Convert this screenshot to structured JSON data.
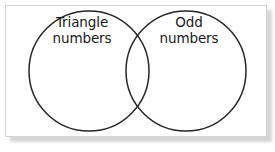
{
  "figure": {
    "name": "venn-diagram",
    "type": "two-set-venn",
    "background_color": "#ffffff",
    "card": {
      "border_color": "#d2d2d2",
      "fill_color": "#ffffff",
      "shadow_color": "#c9c9c9"
    },
    "stroke_color": "#262626",
    "stroke_width": 1.5,
    "text_color": "#1a1a1a"
  },
  "sets": [
    {
      "id": "left",
      "label_line1": "Triangle",
      "label_line2": "numbers",
      "center_x": 89,
      "center_y": 71,
      "radius": 60
    },
    {
      "id": "right",
      "label_line1": "Odd",
      "label_line2": "numbers",
      "center_x": 186,
      "center_y": 71,
      "radius": 60
    }
  ],
  "intersection": {
    "label": "",
    "upper_crossing_x": 137,
    "upper_crossing_y": 28,
    "lower_crossing_x": 137,
    "lower_crossing_y": 114
  }
}
